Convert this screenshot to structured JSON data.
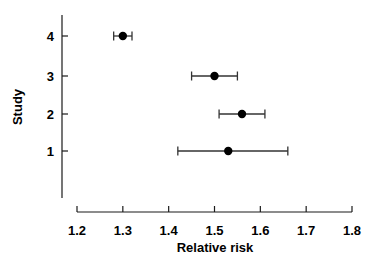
{
  "chart_data": {
    "type": "scatter",
    "subtype": "forest-plot",
    "title": "",
    "xlabel": "Relative risk",
    "ylabel": "Study",
    "xlim": [
      1.2,
      1.8
    ],
    "xticks": [
      1.2,
      1.3,
      1.4,
      1.5,
      1.6,
      1.7,
      1.8
    ],
    "xtick_labels": [
      "1.2",
      "1.3",
      "1.4",
      "1.5",
      "1.6",
      "1.7",
      "1.8"
    ],
    "categories": [
      "4",
      "3",
      "2",
      "1"
    ],
    "ytick_labels": [
      "4",
      "3",
      "2",
      "1"
    ],
    "grid": false,
    "legend": false,
    "marker_color": "#000000",
    "line_color": "#333333",
    "background_color": "#ffffff",
    "points": [
      {
        "study": "4",
        "estimate": 1.3,
        "ci_low": 1.28,
        "ci_high": 1.32
      },
      {
        "study": "3",
        "estimate": 1.5,
        "ci_low": 1.45,
        "ci_high": 1.55
      },
      {
        "study": "2",
        "estimate": 1.56,
        "ci_low": 1.51,
        "ci_high": 1.61
      },
      {
        "study": "1",
        "estimate": 1.53,
        "ci_low": 1.42,
        "ci_high": 1.66
      }
    ]
  },
  "axes": {
    "x_title": "Relative risk",
    "y_title": "Study"
  }
}
